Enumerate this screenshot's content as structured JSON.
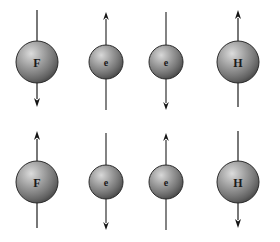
{
  "figure": {
    "width": 280,
    "height": 242,
    "background_color": "#ffffff",
    "arrow_color": "#141414",
    "sphere_highlight_color": "#d8d8d8",
    "sphere_mid_color": "#8f8f8f",
    "sphere_shadow_color": "#4a4a4a",
    "sphere_outline_color": "#2b2b2b",
    "label_color": "#1a1a1a"
  },
  "rows": [
    {
      "name": "top-row",
      "center_y": 62,
      "particles": [
        {
          "id": "top-fluorine",
          "label": "F",
          "kind": "nucleus",
          "cx": 37,
          "cy": 62,
          "r": 21,
          "font_size": 12,
          "spin": "down",
          "arrow_top_y": 10,
          "arrow_bottom_y": 107
        },
        {
          "id": "top-electron-1",
          "label": "e",
          "kind": "electron",
          "cx": 106,
          "cy": 62,
          "r": 17,
          "font_size": 10,
          "spin": "up",
          "arrow_top_y": 12,
          "arrow_bottom_y": 110
        },
        {
          "id": "top-electron-2",
          "label": "e",
          "kind": "electron",
          "cx": 166,
          "cy": 62,
          "r": 17,
          "font_size": 10,
          "spin": "down",
          "arrow_top_y": 12,
          "arrow_bottom_y": 110
        },
        {
          "id": "top-hydrogen",
          "label": "H",
          "kind": "nucleus",
          "cx": 238,
          "cy": 62,
          "r": 21,
          "font_size": 12,
          "spin": "up",
          "arrow_top_y": 10,
          "arrow_bottom_y": 107
        }
      ]
    },
    {
      "name": "bottom-row",
      "center_y": 182,
      "particles": [
        {
          "id": "bottom-fluorine",
          "label": "F",
          "kind": "nucleus",
          "cx": 37,
          "cy": 182,
          "r": 21,
          "font_size": 12,
          "spin": "up",
          "arrow_top_y": 131,
          "arrow_bottom_y": 228
        },
        {
          "id": "bottom-electron-1",
          "label": "e",
          "kind": "electron",
          "cx": 106,
          "cy": 182,
          "r": 17,
          "font_size": 10,
          "spin": "down",
          "arrow_top_y": 133,
          "arrow_bottom_y": 230
        },
        {
          "id": "bottom-electron-2",
          "label": "e",
          "kind": "electron",
          "cx": 166,
          "cy": 182,
          "r": 17,
          "font_size": 10,
          "spin": "up",
          "arrow_top_y": 133,
          "arrow_bottom_y": 230
        },
        {
          "id": "bottom-hydrogen",
          "label": "H",
          "kind": "nucleus",
          "cx": 238,
          "cy": 182,
          "r": 21,
          "font_size": 12,
          "spin": "down",
          "arrow_top_y": 131,
          "arrow_bottom_y": 228
        }
      ]
    }
  ]
}
